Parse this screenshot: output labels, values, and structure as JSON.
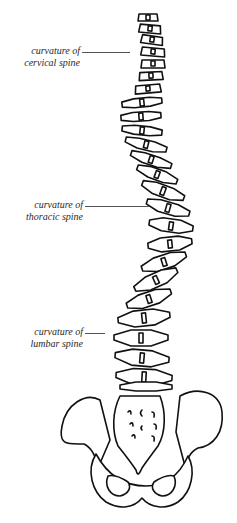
{
  "diagram": {
    "labels": [
      {
        "line1": "curvature of",
        "line2": "cervical spine"
      },
      {
        "line1": "curvature of",
        "line2": "thoracic spine"
      },
      {
        "line1": "curvature of",
        "line2": "lumbar spine"
      }
    ],
    "colors": {
      "ink": "#111111",
      "background": "#ffffff",
      "label_text": "#2a2a2a"
    }
  }
}
